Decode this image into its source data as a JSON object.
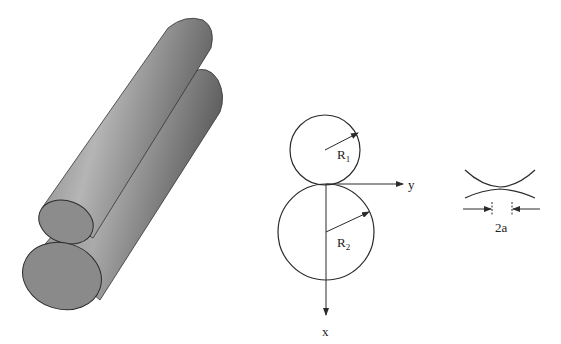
{
  "figure": {
    "panels": [
      {
        "id": "cylinders-3d",
        "label": "Two cylinders in contact (isometric)"
      },
      {
        "id": "cross-section",
        "label": "Cross section of contacting cylinders"
      },
      {
        "id": "contact-zone",
        "label": "Contact zone detail"
      }
    ]
  },
  "labels": {
    "radius1": "R",
    "radius1_sub": "1",
    "radius2": "R",
    "radius2_sub": "2",
    "axis_y": "y",
    "axis_x": "x",
    "contact_width": "2a"
  },
  "colors": {
    "stroke": "#2a2a2a",
    "cylinder_light": "#b8b8b8",
    "cylinder_dark": "#6a6a6a",
    "end_face": "#8a8a8a"
  }
}
